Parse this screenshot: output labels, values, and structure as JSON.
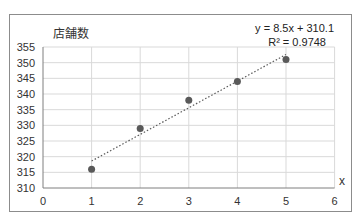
{
  "chart_data": {
    "type": "scatter",
    "title": "",
    "xlabel": "x",
    "ylabel": "店舗数",
    "xlim": [
      0,
      6
    ],
    "ylim": [
      310,
      355
    ],
    "x_ticks": [
      "0",
      "1",
      "2",
      "3",
      "4",
      "5",
      "6"
    ],
    "y_ticks": [
      "310",
      "315",
      "320",
      "325",
      "330",
      "335",
      "340",
      "345",
      "350",
      "355"
    ],
    "grid": true,
    "legend": null,
    "series": [
      {
        "name": "店舗数",
        "x": [
          1,
          2,
          3,
          4,
          5
        ],
        "y": [
          316,
          329,
          338,
          344,
          351
        ],
        "color": "#595959"
      }
    ],
    "trendline": {
      "type": "linear",
      "style": "dotted",
      "slope": 8.5,
      "intercept": 310.1,
      "x_range": [
        1,
        5
      ],
      "equation_label": "y = 8.5x + 310.1",
      "r2_label": "R² = 0.9748"
    }
  },
  "labels": {
    "ylabel": "店舗数",
    "xlabel": "x",
    "equation": "y = 8.5x + 310.1",
    "r2": "R² = 0.9748"
  }
}
